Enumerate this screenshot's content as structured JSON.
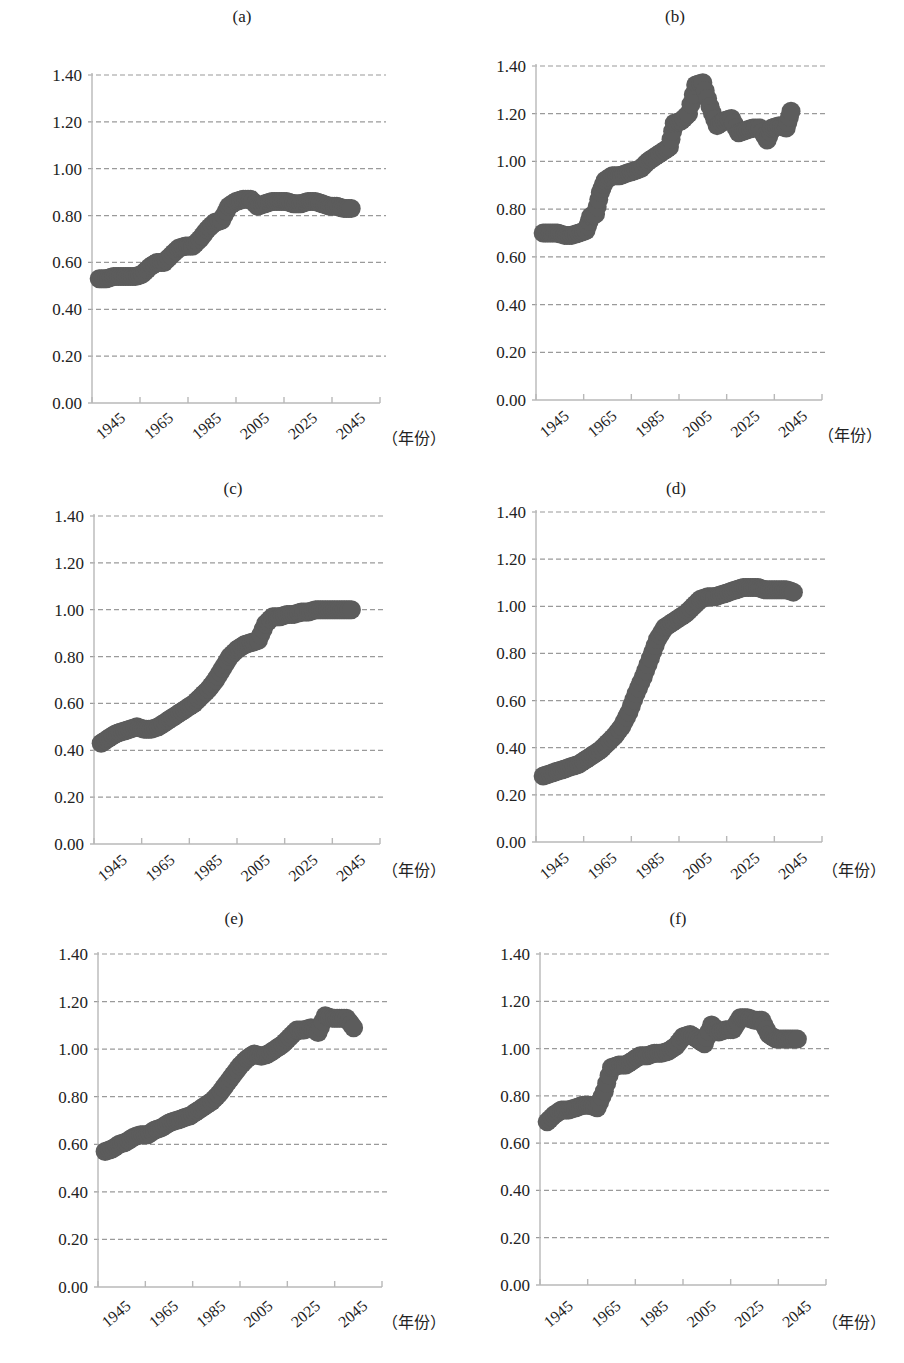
{
  "figure": {
    "unit_label": "（年份）",
    "colors": {
      "dots": "#5c5c5c",
      "grid": "#9a9a9a",
      "axis": "#b8b8b8",
      "text": "#222222"
    }
  },
  "chart_data": [
    {
      "type": "scatter",
      "title": "(a)",
      "xlabel": "（年份）",
      "ylabel": "",
      "ylim": [
        0,
        1.4
      ],
      "yticks": [
        "0.00",
        "0.20",
        "0.40",
        "0.60",
        "0.80",
        "1.00",
        "1.20",
        "1.40"
      ],
      "xticks": [
        "1945",
        "1965",
        "1985",
        "2005",
        "2025",
        "2045"
      ],
      "xlim": [
        1935,
        2055
      ],
      "grid": true,
      "legend": "none",
      "x": [
        1938,
        1941,
        1944,
        1947,
        1950,
        1953,
        1956,
        1959,
        1962,
        1965,
        1968,
        1971,
        1974,
        1977,
        1980,
        1983,
        1986,
        1989,
        1992,
        1995,
        1998,
        2001,
        2004,
        2007,
        2010,
        2013,
        2016,
        2019,
        2022,
        2025,
        2028,
        2031,
        2034,
        2037,
        2040,
        2043
      ],
      "values": [
        0.53,
        0.53,
        0.54,
        0.54,
        0.54,
        0.54,
        0.55,
        0.58,
        0.6,
        0.6,
        0.63,
        0.66,
        0.67,
        0.67,
        0.7,
        0.74,
        0.77,
        0.78,
        0.84,
        0.86,
        0.87,
        0.87,
        0.84,
        0.85,
        0.86,
        0.86,
        0.86,
        0.85,
        0.85,
        0.86,
        0.86,
        0.85,
        0.84,
        0.84,
        0.83,
        0.83
      ]
    },
    {
      "type": "scatter",
      "title": "(b)",
      "xlabel": "（年份）",
      "ylabel": "",
      "ylim": [
        0,
        1.4
      ],
      "yticks": [
        "0.00",
        "0.20",
        "0.40",
        "0.60",
        "0.80",
        "1.00",
        "1.20",
        "1.40"
      ],
      "xticks": [
        "1945",
        "1965",
        "1985",
        "2005",
        "2025",
        "2045"
      ],
      "xlim": [
        1935,
        2055
      ],
      "grid": true,
      "legend": "none",
      "x": [
        1938,
        1941,
        1944,
        1947,
        1950,
        1953,
        1956,
        1958,
        1960,
        1962,
        1964,
        1967,
        1970,
        1973,
        1976,
        1979,
        1982,
        1985,
        1988,
        1991,
        1993,
        1996,
        1999,
        2002,
        2005,
        2008,
        2011,
        2014,
        2017,
        2020,
        2023,
        2026,
        2029,
        2032,
        2034,
        2037,
        2040,
        2042
      ],
      "values": [
        0.7,
        0.7,
        0.7,
        0.69,
        0.69,
        0.7,
        0.71,
        0.77,
        0.78,
        0.87,
        0.92,
        0.94,
        0.94,
        0.95,
        0.96,
        0.97,
        1.0,
        1.02,
        1.04,
        1.06,
        1.16,
        1.17,
        1.2,
        1.32,
        1.33,
        1.23,
        1.15,
        1.17,
        1.18,
        1.12,
        1.13,
        1.14,
        1.14,
        1.09,
        1.14,
        1.15,
        1.14,
        1.21
      ]
    },
    {
      "type": "scatter",
      "title": "(c)",
      "xlabel": "（年份）",
      "ylabel": "",
      "ylim": [
        0,
        1.4
      ],
      "yticks": [
        "0.00",
        "0.20",
        "0.40",
        "0.60",
        "0.80",
        "1.00",
        "1.20",
        "1.40"
      ],
      "xticks": [
        "1945",
        "1965",
        "1985",
        "2005",
        "2025",
        "2045"
      ],
      "xlim": [
        1935,
        2055
      ],
      "grid": true,
      "legend": "none",
      "x": [
        1938,
        1941,
        1944,
        1947,
        1950,
        1953,
        1956,
        1959,
        1962,
        1965,
        1968,
        1971,
        1974,
        1977,
        1980,
        1983,
        1986,
        1989,
        1992,
        1995,
        1998,
        2001,
        2004,
        2007,
        2010,
        2013,
        2016,
        2019,
        2022,
        2025,
        2028,
        2031,
        2034,
        2037,
        2040,
        2043
      ],
      "values": [
        0.43,
        0.45,
        0.47,
        0.48,
        0.49,
        0.5,
        0.49,
        0.49,
        0.5,
        0.52,
        0.54,
        0.56,
        0.58,
        0.6,
        0.63,
        0.66,
        0.7,
        0.75,
        0.8,
        0.83,
        0.85,
        0.86,
        0.87,
        0.94,
        0.97,
        0.97,
        0.98,
        0.98,
        0.99,
        0.99,
        1.0,
        1.0,
        1.0,
        1.0,
        1.0,
        1.0
      ]
    },
    {
      "type": "scatter",
      "title": "(d)",
      "xlabel": "（年份）",
      "ylabel": "",
      "ylim": [
        0,
        1.4
      ],
      "yticks": [
        "0.00",
        "0.20",
        "0.40",
        "0.60",
        "0.80",
        "1.00",
        "1.20",
        "1.40"
      ],
      "xticks": [
        "1945",
        "1965",
        "1985",
        "2005",
        "2025",
        "2045"
      ],
      "xlim": [
        1935,
        2055
      ],
      "grid": true,
      "legend": "none",
      "x": [
        1938,
        1941,
        1944,
        1947,
        1950,
        1953,
        1956,
        1959,
        1962,
        1965,
        1968,
        1971,
        1974,
        1977,
        1980,
        1983,
        1986,
        1989,
        1992,
        1995,
        1998,
        2001,
        2004,
        2007,
        2010,
        2013,
        2016,
        2019,
        2022,
        2025,
        2028,
        2031,
        2034,
        2037,
        2040,
        2043
      ],
      "values": [
        0.28,
        0.29,
        0.3,
        0.31,
        0.32,
        0.33,
        0.35,
        0.37,
        0.39,
        0.42,
        0.45,
        0.49,
        0.55,
        0.63,
        0.7,
        0.78,
        0.86,
        0.91,
        0.93,
        0.95,
        0.97,
        1.0,
        1.03,
        1.04,
        1.04,
        1.05,
        1.06,
        1.07,
        1.08,
        1.08,
        1.08,
        1.07,
        1.07,
        1.07,
        1.07,
        1.06
      ]
    },
    {
      "type": "scatter",
      "title": "(e)",
      "xlabel": "（年份）",
      "ylabel": "",
      "ylim": [
        0,
        1.4
      ],
      "yticks": [
        "0.00",
        "0.20",
        "0.40",
        "0.60",
        "0.80",
        "1.00",
        "1.20",
        "1.40"
      ],
      "xticks": [
        "1945",
        "1965",
        "1985",
        "2005",
        "2025",
        "2045"
      ],
      "xlim": [
        1935,
        2055
      ],
      "grid": true,
      "legend": "none",
      "x": [
        1938,
        1941,
        1944,
        1947,
        1950,
        1953,
        1956,
        1959,
        1962,
        1965,
        1968,
        1971,
        1974,
        1977,
        1980,
        1983,
        1986,
        1989,
        1992,
        1995,
        1998,
        2001,
        2004,
        2007,
        2010,
        2013,
        2016,
        2019,
        2022,
        2025,
        2028,
        2031,
        2034,
        2037,
        2040,
        2043
      ],
      "values": [
        0.57,
        0.58,
        0.6,
        0.61,
        0.63,
        0.64,
        0.64,
        0.66,
        0.67,
        0.69,
        0.7,
        0.71,
        0.72,
        0.74,
        0.76,
        0.78,
        0.81,
        0.85,
        0.89,
        0.93,
        0.96,
        0.98,
        0.97,
        0.98,
        1.0,
        1.02,
        1.05,
        1.08,
        1.08,
        1.09,
        1.07,
        1.14,
        1.13,
        1.13,
        1.13,
        1.09
      ]
    },
    {
      "type": "scatter",
      "title": "(f)",
      "xlabel": "（年份）",
      "ylabel": "",
      "ylim": [
        0,
        1.4
      ],
      "yticks": [
        "0.00",
        "0.20",
        "0.40",
        "0.60",
        "0.80",
        "1.00",
        "1.20",
        "1.40"
      ],
      "xticks": [
        "1945",
        "1965",
        "1985",
        "2005",
        "2025",
        "2045"
      ],
      "xlim": [
        1935,
        2055
      ],
      "grid": true,
      "legend": "none",
      "x": [
        1938,
        1941,
        1944,
        1947,
        1950,
        1953,
        1956,
        1959,
        1962,
        1965,
        1968,
        1971,
        1974,
        1977,
        1980,
        1983,
        1986,
        1989,
        1992,
        1995,
        1998,
        2001,
        2004,
        2007,
        2010,
        2013,
        2016,
        2019,
        2022,
        2025,
        2028,
        2031,
        2034,
        2037,
        2040,
        2043
      ],
      "values": [
        0.69,
        0.72,
        0.74,
        0.74,
        0.75,
        0.76,
        0.76,
        0.75,
        0.82,
        0.92,
        0.93,
        0.93,
        0.95,
        0.97,
        0.97,
        0.98,
        0.98,
        0.99,
        1.01,
        1.05,
        1.06,
        1.04,
        1.02,
        1.1,
        1.07,
        1.08,
        1.08,
        1.13,
        1.13,
        1.12,
        1.12,
        1.06,
        1.04,
        1.04,
        1.04,
        1.04
      ]
    }
  ]
}
